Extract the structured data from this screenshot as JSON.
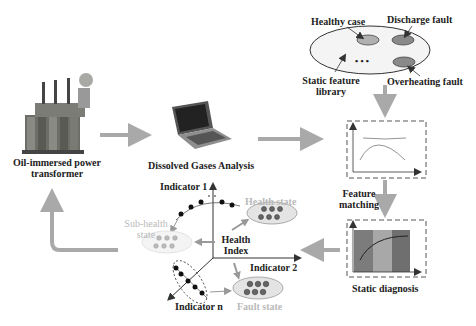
{
  "nodes": {
    "transformer": {
      "label_line1": "Oil-immersed power",
      "label_line2": "transformer",
      "icon": "transformer-icon"
    },
    "dga": {
      "label": "Dissolved Gases Analysis",
      "icon": "laptop-icon"
    },
    "library": {
      "healthy": "Healthy case",
      "discharge": "Discharge fault",
      "overheating": "Overheating fault",
      "static_line1": "Static feature",
      "static_line2": "library",
      "ellipsis": "• • •"
    },
    "feature_matching": {
      "line1": "Feature",
      "line2": "matching"
    },
    "static_diagnosis": {
      "label": "Static diagnosis"
    },
    "health_space": {
      "indicator1": "Indicator 1",
      "indicator2": "Indicator 2",
      "indicatorn": "Indicator n",
      "health_index_line1": "Health",
      "health_index_line2": "Index",
      "health_state": "Health state",
      "subhealth_line1": "Sub-health",
      "subhealth_line2": "state",
      "fault_state": "Fault state"
    }
  },
  "colors": {
    "arrow": "#a9a9a9",
    "ellipse_fill": "#f1f1f1",
    "dark_ellipse": "#8a8a8a",
    "light_ellipse": "#b0b0b0",
    "faint_text": "#b9b9b9"
  }
}
